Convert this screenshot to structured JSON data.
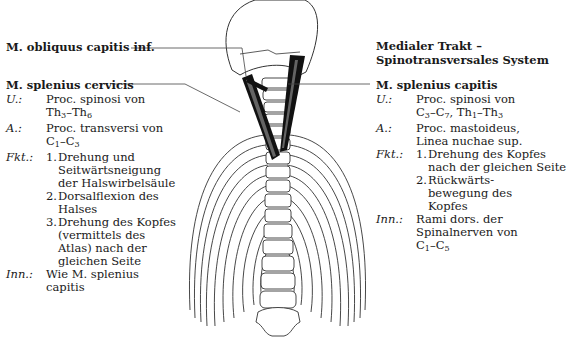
{
  "labels": {
    "obliquus": "M. obliquus capitis inf.",
    "header_line1": "Medialer Trakt –",
    "header_line2": "Spinotransversales System",
    "splenius_cervicis": "M. splenius cervicis",
    "splenius_capitis": "M. splenius capitis"
  },
  "left": {
    "u_key": "U.:",
    "u_text1": "Proc. spinosi von",
    "u_text2": "Th3–Th6",
    "a_key": "A.:",
    "a_text1": "Proc. transversi von",
    "a_text2": "C1–C3",
    "fkt_key": "Fkt.:",
    "fkt": [
      {
        "n": "1.",
        "lines": [
          "Drehung und",
          "Seitwärtsneigung",
          "der Halswirbelsäule"
        ]
      },
      {
        "n": "2.",
        "lines": [
          "Dorsalflexion des",
          "Halses"
        ]
      },
      {
        "n": "3.",
        "lines": [
          "Drehung des Kopfes",
          "(vermittels des",
          "Atlas) nach der",
          "gleichen Seite"
        ]
      }
    ],
    "inn_key": "Inn.:",
    "inn_text1": "Wie M. splenius",
    "inn_text2": "capitis"
  },
  "right": {
    "u_key": "U.:",
    "u_text1": "Proc. spinosi von",
    "u_text2": "C3–C7, Th1–Th3",
    "a_key": "A.:",
    "a_text1": "Proc. mastoideus,",
    "a_text2": "Linea nuchae sup.",
    "fkt_key": "Fkt.:",
    "fkt": [
      {
        "n": "1.",
        "lines": [
          "Drehung des Kopfes",
          "nach der gleichen Seite"
        ]
      },
      {
        "n": "2.",
        "lines": [
          "Rückwärts-",
          "bewegung des",
          "Kopfes"
        ]
      }
    ],
    "inn_key": "Inn.:",
    "inn_text1": "Rami dors. der",
    "inn_text2": "Spinalnerven von",
    "inn_text3": "C1–C5"
  }
}
